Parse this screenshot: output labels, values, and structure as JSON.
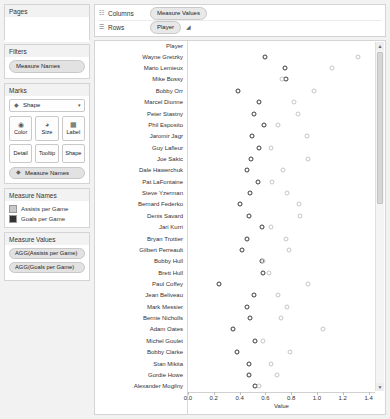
{
  "sidebar": {
    "pages": {
      "title": "Pages"
    },
    "filters": {
      "title": "Filters",
      "items": [
        "Measure Names"
      ]
    },
    "marks": {
      "title": "Marks",
      "shape_label": "Shape",
      "shape_icon": "shape-icon",
      "caret": "▾",
      "buttons": [
        {
          "label": "Color",
          "icon": "color-palette-icon",
          "glyph": "◕"
        },
        {
          "label": "Size",
          "icon": "size-icon",
          "glyph": "◔"
        },
        {
          "label": "Label",
          "icon": "label-icon",
          "glyph": "▦"
        },
        {
          "label": "Detail",
          "icon": "detail-icon",
          "glyph": ""
        },
        {
          "label": "Tooltip",
          "icon": "tooltip-icon",
          "glyph": ""
        },
        {
          "label": "Shape",
          "icon": "shape-icon",
          "glyph": ""
        }
      ],
      "pill": "Measure Names",
      "pill_icon": "shape-icon"
    },
    "measure_names_legend": {
      "title": "Measure Names",
      "entries": [
        {
          "label": "Assists per Game",
          "color": "#c8c8c8"
        },
        {
          "label": "Goals per Game",
          "color": "#333333"
        }
      ]
    },
    "measure_values": {
      "title": "Measure Values",
      "pills": [
        "AGG(Assists per Game)",
        "AGG(Goals per Game)"
      ]
    }
  },
  "shelves": {
    "columns": {
      "label": "Columns",
      "icon": "columns-icon",
      "pills": [
        "Measure Values"
      ]
    },
    "rows": {
      "label": "Rows",
      "icon": "rows-icon",
      "pills": [
        "Player"
      ],
      "sort_icon": "sort-icon"
    }
  },
  "chart_data": {
    "type": "scatter",
    "title": "",
    "xlabel": "Value",
    "ylabel": "Player",
    "row_header_title": "Player",
    "xlim": [
      0.0,
      1.45
    ],
    "xticks": [
      0.0,
      0.2,
      0.4,
      0.6,
      0.8,
      1.0,
      1.2,
      1.4
    ],
    "xtick_labels": [
      "0.0",
      "0.2",
      "0.4",
      "0.6",
      "0.8",
      "1.0",
      "1.2",
      "1.4"
    ],
    "grid": false,
    "legend_position": "sidebar",
    "categories": [
      "Wayne Gretzky",
      "Mario Lemieux",
      "Mike Bossy",
      "Bobby Orr",
      "Marcel Dionne",
      "Peter Stastny",
      "Phil Esposito",
      "Jaromir Jagr",
      "Guy Lafleur",
      "Joe Sakic",
      "Dale Hawerchuk",
      "Pat LaFontaine",
      "Steve Yzerman",
      "Bernard Federko",
      "Denis Savard",
      "Jari Kurri",
      "Bryan Trottier",
      "Gilbert Perreault",
      "Bobby Hull",
      "Brett Hull",
      "Paul Coffey",
      "Jean Beliveau",
      "Mark Messier",
      "Bernie Nicholls",
      "Adam Oates",
      "Michel Goulet",
      "Bobby Clarke",
      "Stan Mikita",
      "Gordie Howe",
      "Alexander Mogilny"
    ],
    "series": [
      {
        "name": "Goals per Game",
        "color": "#3b3b3b",
        "values": [
          0.6,
          0.75,
          0.76,
          0.39,
          0.55,
          0.51,
          0.59,
          0.5,
          0.55,
          0.49,
          0.46,
          0.54,
          0.48,
          0.4,
          0.47,
          0.57,
          0.46,
          0.42,
          0.57,
          0.58,
          0.24,
          0.51,
          0.46,
          0.48,
          0.35,
          0.52,
          0.38,
          0.47,
          0.47,
          0.52
        ]
      },
      {
        "name": "Assists per Game",
        "color": "#c6c6c6",
        "values": [
          1.32,
          1.12,
          0.73,
          0.98,
          0.82,
          0.85,
          0.7,
          0.92,
          0.64,
          0.93,
          0.74,
          0.65,
          0.77,
          0.86,
          0.87,
          0.64,
          0.76,
          0.78,
          0.58,
          0.63,
          0.93,
          0.7,
          0.77,
          0.72,
          1.05,
          0.58,
          0.79,
          0.64,
          0.69,
          0.55
        ]
      }
    ]
  },
  "scrollbar": {
    "up": "▲",
    "down": "▼"
  }
}
